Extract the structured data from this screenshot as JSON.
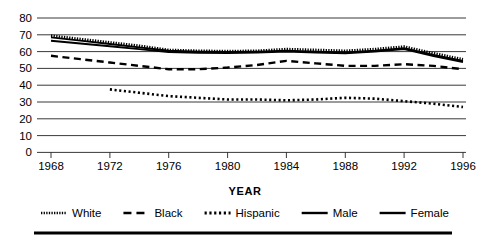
{
  "chart_data": {
    "type": "line",
    "title": "",
    "xlabel": "YEAR",
    "ylabel": "",
    "x": [
      1968,
      1970,
      1972,
      1974,
      1976,
      1978,
      1980,
      1982,
      1984,
      1986,
      1988,
      1990,
      1992,
      1994,
      1996
    ],
    "categories": [
      "1968",
      "1972",
      "1976",
      "1980",
      "1984",
      "1988",
      "1992",
      "1996"
    ],
    "xlim": [
      1967,
      1997
    ],
    "ylim": [
      0,
      80
    ],
    "yticks": [
      0,
      10,
      20,
      30,
      40,
      50,
      60,
      70,
      80
    ],
    "xticks": [
      1968,
      1972,
      1976,
      1980,
      1984,
      1988,
      1992,
      1996
    ],
    "grid": true,
    "legend_position": "bottom",
    "series": [
      {
        "name": "White",
        "style": "fine-dotted",
        "x": [
          1968,
          1970,
          1972,
          1974,
          1976,
          1978,
          1980,
          1982,
          1984,
          1986,
          1988,
          1990,
          1992,
          1994,
          1996
        ],
        "values": [
          69.5,
          67.5,
          65.5,
          63.5,
          61.0,
          60.5,
          60.3,
          60.5,
          61.5,
          61.0,
          60.5,
          61.5,
          63.0,
          59.0,
          55.5
        ]
      },
      {
        "name": "Black",
        "style": "dashed",
        "x": [
          1968,
          1970,
          1972,
          1974,
          1976,
          1978,
          1980,
          1982,
          1984,
          1986,
          1988,
          1990,
          1992,
          1994,
          1996
        ],
        "values": [
          57.5,
          55.5,
          53.5,
          51.5,
          49.5,
          49.5,
          50.5,
          52.0,
          54.5,
          53.0,
          51.5,
          51.5,
          52.5,
          51.5,
          49.5
        ]
      },
      {
        "name": "Hispanic",
        "style": "coarse-dotted",
        "x": [
          1972,
          1974,
          1976,
          1978,
          1980,
          1982,
          1984,
          1986,
          1988,
          1990,
          1992,
          1994,
          1996
        ],
        "values": [
          37.5,
          35.5,
          33.5,
          32.5,
          31.5,
          31.5,
          31.0,
          31.5,
          32.5,
          32.0,
          30.5,
          29.0,
          27.0
        ]
      },
      {
        "name": "Male",
        "style": "solid",
        "x": [
          1968,
          1970,
          1972,
          1974,
          1976,
          1978,
          1980,
          1982,
          1984,
          1986,
          1988,
          1990,
          1992,
          1994,
          1996
        ],
        "values": [
          68.5,
          66.5,
          64.5,
          62.5,
          60.5,
          60.0,
          59.8,
          60.0,
          60.5,
          60.0,
          59.5,
          60.5,
          62.0,
          58.0,
          54.5
        ]
      },
      {
        "name": "Female",
        "style": "solid",
        "x": [
          1968,
          1970,
          1972,
          1974,
          1976,
          1978,
          1980,
          1982,
          1984,
          1986,
          1988,
          1990,
          1992,
          1994,
          1996
        ],
        "values": [
          66.5,
          64.8,
          63.2,
          61.5,
          59.8,
          59.3,
          59.2,
          59.4,
          60.0,
          59.4,
          59.0,
          60.0,
          61.5,
          57.3,
          53.8
        ]
      }
    ]
  },
  "axis": {
    "y_tick_labels": [
      "80",
      "70",
      "60",
      "50",
      "40",
      "30",
      "20",
      "10",
      "0"
    ],
    "x_tick_labels": [
      "1968",
      "1972",
      "1976",
      "1980",
      "1984",
      "1988",
      "1992",
      "1996"
    ],
    "x_axis_title": "YEAR"
  },
  "legend": {
    "items": [
      {
        "label": "White",
        "swatch": "fine-dotted-swatch"
      },
      {
        "label": "Black",
        "swatch": "dashed-swatch"
      },
      {
        "label": "Hispanic",
        "swatch": "coarse-dotted-swatch"
      },
      {
        "label": "Male",
        "swatch": "solid-swatch"
      },
      {
        "label": "Female",
        "swatch": "solid-swatch"
      }
    ]
  },
  "colors": {
    "ink": "#000000",
    "grid": "#222222",
    "background": "#ffffff"
  }
}
